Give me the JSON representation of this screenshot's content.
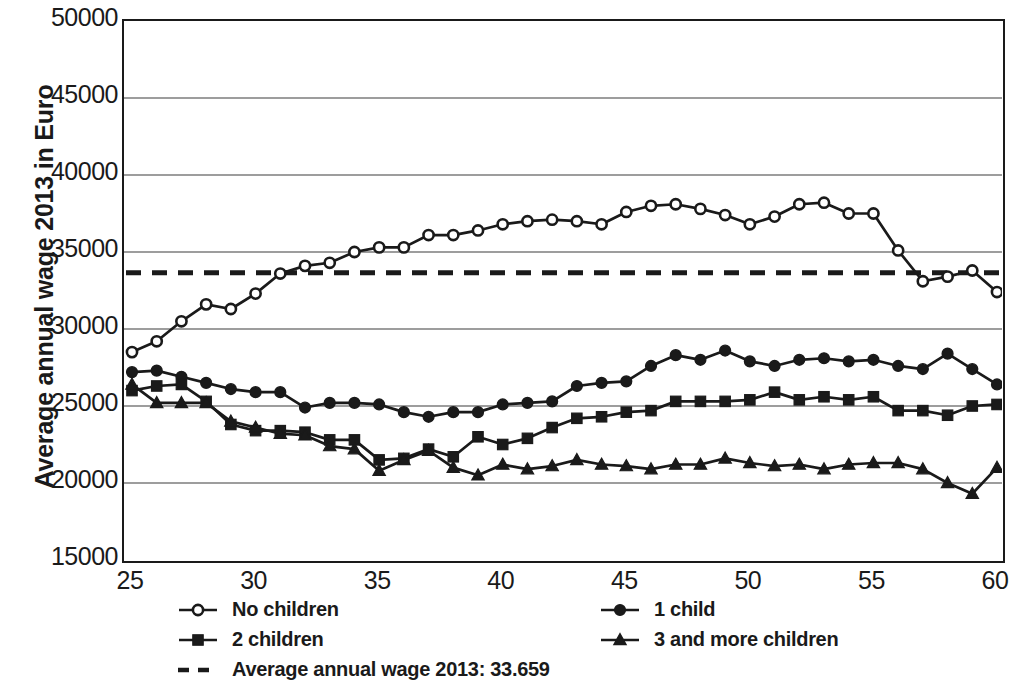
{
  "chart_data": {
    "type": "line",
    "title": "",
    "subtitle": "",
    "xlabel": "",
    "ylabel": "Average annual wage 2013 in Euro",
    "xlim": [
      25,
      60
    ],
    "ylim": [
      15000,
      50000
    ],
    "xticks": [
      25,
      30,
      35,
      40,
      45,
      50,
      55,
      60
    ],
    "yticks": [
      15000,
      20000,
      25000,
      30000,
      35000,
      40000,
      45000,
      50000
    ],
    "ytick_labels": [
      "15000",
      "20000",
      "25000",
      "30000",
      "35000",
      "40000",
      "45000",
      "50000"
    ],
    "xtick_labels": [
      "25",
      "30",
      "35",
      "40",
      "45",
      "50",
      "55",
      "60"
    ],
    "grid": "horizontal",
    "legend_position": "bottom",
    "x": [
      25,
      26,
      27,
      28,
      29,
      30,
      31,
      32,
      33,
      34,
      35,
      36,
      37,
      38,
      39,
      40,
      41,
      42,
      43,
      44,
      45,
      46,
      47,
      48,
      49,
      50,
      51,
      52,
      53,
      54,
      55,
      56,
      57,
      58,
      59,
      60
    ],
    "series": [
      {
        "name": "No children",
        "marker": "open-circle",
        "values": [
          28500,
          29200,
          30500,
          31600,
          31300,
          32300,
          33600,
          34100,
          34300,
          35000,
          35300,
          35300,
          36100,
          36100,
          36400,
          36800,
          37000,
          37100,
          37000,
          36800,
          37600,
          38000,
          38100,
          37800,
          37400,
          36800,
          37300,
          38100,
          38200,
          37500,
          37500,
          35100,
          33100,
          33400,
          33800,
          32400
        ]
      },
      {
        "name": "1 child",
        "marker": "filled-circle",
        "values": [
          27200,
          27300,
          26900,
          26500,
          26100,
          25900,
          25900,
          24900,
          25200,
          25200,
          25100,
          24600,
          24300,
          24600,
          24600,
          25100,
          25200,
          25300,
          26300,
          26500,
          26600,
          27600,
          28300,
          28000,
          28600,
          27900,
          27600,
          28000,
          28100,
          27900,
          28000,
          27600,
          27400,
          28400,
          27400,
          26400
        ]
      },
      {
        "name": "2 children",
        "marker": "filled-square",
        "values": [
          26000,
          26300,
          26400,
          25300,
          23800,
          23400,
          23400,
          23300,
          22800,
          22800,
          21500,
          21600,
          22200,
          21700,
          23000,
          22500,
          22900,
          23600,
          24200,
          24300,
          24600,
          24700,
          25300,
          25300,
          25300,
          25400,
          25900,
          25400,
          25600,
          25400,
          25600,
          24700,
          24700,
          24400,
          25000,
          25100
        ]
      },
      {
        "name": "3 and more children",
        "marker": "filled-triangle",
        "values": [
          26400,
          25200,
          25200,
          25200,
          24000,
          23600,
          23200,
          23100,
          22400,
          22200,
          20800,
          21500,
          22100,
          21000,
          20500,
          21200,
          20900,
          21100,
          21500,
          21200,
          21100,
          20900,
          21200,
          21200,
          21600,
          21300,
          21100,
          21200,
          20900,
          21200,
          21300,
          21300,
          20900,
          20000,
          19300,
          21000
        ]
      }
    ],
    "reference_line": {
      "label": "Average annual wage 2013: 33.659",
      "value": 33659,
      "style": "dashed"
    }
  },
  "legend": {
    "items": [
      {
        "label": "No children",
        "marker": "open-circle"
      },
      {
        "label": "1 child",
        "marker": "filled-circle"
      },
      {
        "label": "2 children",
        "marker": "filled-square"
      },
      {
        "label": "3 and more children",
        "marker": "filled-triangle"
      },
      {
        "label": "Average annual wage 2013: 33.659",
        "marker": "dashed-line"
      }
    ]
  },
  "colors": {
    "ink": "#1a1a1a",
    "grid": "#7d7d7d",
    "background": "#ffffff"
  }
}
